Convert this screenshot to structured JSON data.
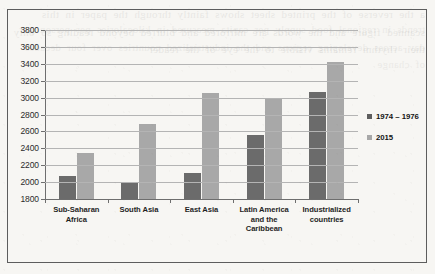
{
  "chart_data": {
    "type": "bar",
    "title": "",
    "xlabel": "",
    "ylabel": "",
    "ylim": [
      1800,
      3800
    ],
    "ytick_step": 200,
    "yticks": [
      "3800",
      "3600",
      "3400",
      "3200",
      "3000",
      "2800",
      "2600",
      "2400",
      "2200",
      "2000",
      "1800"
    ],
    "grid": true,
    "legend_position": "right",
    "categories": [
      "Sub-Saharan Africa",
      "South Asia",
      "East Asia",
      "Latin America and the Caribbean",
      "Industrialized countries"
    ],
    "category_lines": [
      [
        "Sub-Saharan",
        "Africa"
      ],
      [
        "South Asia"
      ],
      [
        "East Asia"
      ],
      [
        "Latin America",
        "and the",
        "Caribbean"
      ],
      [
        "Industrialized",
        "countries"
      ]
    ],
    "series": [
      {
        "name": "1974 – 1976",
        "color": "#6b6b6b",
        "values": [
          2075,
          1985,
          2105,
          2555,
          3070
        ]
      },
      {
        "name": "2015",
        "color": "#a8a8a8",
        "values": [
          2350,
          2690,
          3060,
          2980,
          3420
        ]
      }
    ]
  },
  "legend": {
    "items": [
      {
        "label": "1974 – 1976",
        "swatch": "#5e5e5e"
      },
      {
        "label": "2015",
        "swatch": "#a8a8a8"
      }
    ]
  },
  "page": {
    "bleed_text_front": "a the reverse of the printed sheet shows faintly through the paper in this scanned figure and the words are mirrored and blurred beyond reading so only their rhythm remains visible to the eye of the reader",
    "bleed_text_back": "trends in regional food supply per capita measured in kilocalories per person per day across developing regions and the industrialized countries over four decades of change"
  }
}
